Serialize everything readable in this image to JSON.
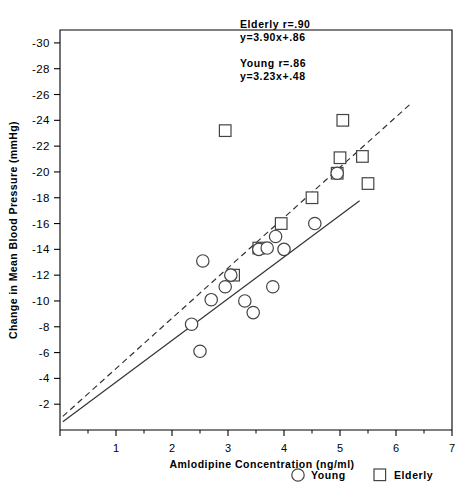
{
  "chart_data": {
    "type": "scatter",
    "title": "",
    "xlabel": "Amlodipine Concentration (ng/ml)",
    "ylabel": "Change in Mean Blood Pressure (mmHg)",
    "xlim": [
      0,
      7
    ],
    "ylim": [
      0,
      -31
    ],
    "xticks": [
      1,
      2,
      3,
      4,
      5,
      6,
      7
    ],
    "xtick_labels": [
      "1",
      "2",
      "3",
      "4",
      "5",
      "6",
      "7"
    ],
    "yticks": [
      -2,
      -4,
      -6,
      -8,
      -10,
      -12,
      -14,
      -16,
      -18,
      -20,
      -22,
      -24,
      -26,
      -28,
      -30
    ],
    "ytick_labels": [
      "-2",
      "-4",
      "-6",
      "-8",
      "-10",
      "-12",
      "-14",
      "-16",
      "-18",
      "-20",
      "-22",
      "-24",
      "-26",
      "-28",
      "-30"
    ],
    "grid": false,
    "legend_position": "below-right",
    "series": [
      {
        "name": "Young",
        "marker": "circle",
        "color": "#444444",
        "points": [
          {
            "x": 2.35,
            "y": -8.2
          },
          {
            "x": 2.5,
            "y": -6.1
          },
          {
            "x": 2.55,
            "y": -13.1
          },
          {
            "x": 2.7,
            "y": -10.1
          },
          {
            "x": 2.95,
            "y": -11.1
          },
          {
            "x": 3.05,
            "y": -12.0
          },
          {
            "x": 3.3,
            "y": -10.0
          },
          {
            "x": 3.45,
            "y": -9.1
          },
          {
            "x": 3.55,
            "y": -14.0
          },
          {
            "x": 3.7,
            "y": -14.1
          },
          {
            "x": 3.8,
            "y": -11.1
          },
          {
            "x": 3.85,
            "y": -15.0
          },
          {
            "x": 4.0,
            "y": -14.0
          },
          {
            "x": 4.55,
            "y": -16.0
          },
          {
            "x": 4.95,
            "y": -19.9
          }
        ]
      },
      {
        "name": "Elderly",
        "marker": "square",
        "color": "#444444",
        "points": [
          {
            "x": 2.95,
            "y": -23.2
          },
          {
            "x": 3.1,
            "y": -12.0
          },
          {
            "x": 3.55,
            "y": -14.1
          },
          {
            "x": 3.95,
            "y": -16.0
          },
          {
            "x": 4.5,
            "y": -18.0
          },
          {
            "x": 4.95,
            "y": -19.9
          },
          {
            "x": 5.0,
            "y": -21.1
          },
          {
            "x": 5.05,
            "y": -24.0
          },
          {
            "x": 5.4,
            "y": -21.2
          },
          {
            "x": 5.5,
            "y": -19.1
          }
        ]
      }
    ],
    "fit_lines": [
      {
        "name": "Elderly",
        "style": "dashed",
        "slope": 3.9,
        "intercept": 0.86,
        "x_start": 0.05,
        "x_end": 6.25
      },
      {
        "name": "Young",
        "style": "solid",
        "slope": 3.23,
        "intercept": 0.48,
        "x_start": 0.05,
        "x_end": 5.35
      }
    ],
    "annotations": [
      {
        "name": "elderly-stats",
        "lines": [
          "Elderly r=.90",
          "y=3.90x+.86"
        ]
      },
      {
        "name": "young-stats",
        "lines": [
          "Young r=.86",
          "y=3.23x+.48"
        ]
      }
    ]
  },
  "legend": {
    "young_label": "Young",
    "elderly_label": "Elderly"
  }
}
